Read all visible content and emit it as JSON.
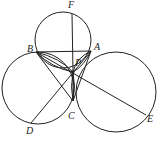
{
  "diagram": {
    "type": "geometry",
    "stroke_color": "#222222",
    "points": {
      "F": {
        "label": "F",
        "x": 72,
        "y": 8
      },
      "B": {
        "label": "B",
        "x": 36,
        "y": 52
      },
      "A": {
        "label": "A",
        "x": 91,
        "y": 51
      },
      "P": {
        "label": "P",
        "x": 73,
        "y": 72
      },
      "C": {
        "label": "C",
        "x": 73,
        "y": 101
      },
      "D": {
        "label": "D",
        "x": 31,
        "y": 123
      },
      "E": {
        "label": "E",
        "x": 146,
        "y": 115
      }
    },
    "circles": [
      {
        "name": "top-circle",
        "cx": 63,
        "cy": 40,
        "r": 28
      },
      {
        "name": "left-circle",
        "cx": 38,
        "cy": 88,
        "r": 36
      },
      {
        "name": "right-circle",
        "cx": 116,
        "cy": 92,
        "r": 40
      }
    ]
  }
}
